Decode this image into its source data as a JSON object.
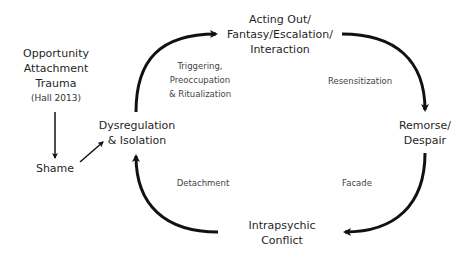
{
  "diagram": {
    "type": "cycle",
    "colors": {
      "arrow": "#111111",
      "node_text": "#1f1f1f",
      "edge_text": "#444444",
      "background": "#ffffff"
    },
    "nodes": {
      "origin": {
        "lines": [
          "Opportunity",
          "Attachment",
          "Trauma"
        ],
        "citation": "(Hall 2013)"
      },
      "shame": {
        "label": "Shame"
      },
      "dysregulation": {
        "lines": [
          "Dysregulation",
          "& Isolation"
        ]
      },
      "acting_out": {
        "lines": [
          "Acting Out/",
          "Fantasy/Escalation/",
          "Interaction"
        ]
      },
      "remorse": {
        "lines": [
          "Remorse/",
          "Despair"
        ]
      },
      "conflict": {
        "lines": [
          "Intrapsychic",
          "Conflict"
        ]
      }
    },
    "edges": {
      "dysregulation_to_acting_out": {
        "lines": [
          "Triggering,",
          "Preoccupation",
          "& Ritualization"
        ]
      },
      "acting_out_to_remorse": {
        "label": "Resensitization"
      },
      "remorse_to_conflict": {
        "label": "Facade"
      },
      "conflict_to_dysregulation": {
        "label": "Detachment"
      }
    }
  }
}
